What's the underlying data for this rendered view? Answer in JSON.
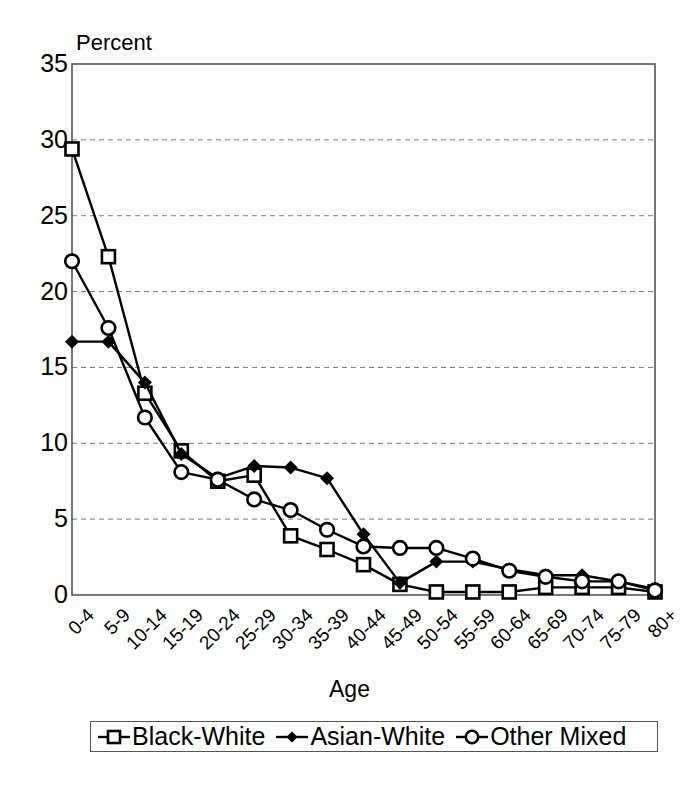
{
  "chart_data": {
    "type": "line",
    "title": "",
    "xlabel": "Age",
    "ylabel": "Percent",
    "ylim": [
      0,
      35
    ],
    "yticks": [
      0,
      5,
      10,
      15,
      20,
      25,
      30,
      35
    ],
    "grid": true,
    "grid_style": "dashed-horizontal",
    "legend_position": "bottom",
    "categories": [
      "0-4",
      "5-9",
      "10-14",
      "15-19",
      "20-24",
      "25-29",
      "30-34",
      "35-39",
      "40-44",
      "45-49",
      "50-54",
      "55-59",
      "60-64",
      "65-69",
      "70-74",
      "75-79",
      "80+"
    ],
    "series": [
      {
        "name": "Black-White",
        "marker": "open-square",
        "values": [
          29.4,
          22.3,
          13.3,
          9.5,
          7.5,
          7.9,
          3.9,
          3.0,
          2.0,
          0.7,
          0.2,
          0.2,
          0.2,
          0.5,
          0.5,
          0.5,
          0.2
        ]
      },
      {
        "name": "Asian-White",
        "marker": "filled-diamond",
        "values": [
          16.7,
          16.7,
          14.0,
          9.3,
          7.7,
          8.5,
          8.4,
          7.7,
          4.0,
          0.8,
          2.2,
          2.2,
          1.7,
          1.3,
          1.3,
          0.9,
          0.4
        ]
      },
      {
        "name": "Other Mixed",
        "marker": "open-circle",
        "values": [
          22.0,
          17.6,
          11.7,
          8.1,
          7.6,
          6.3,
          5.6,
          4.3,
          3.2,
          3.1,
          3.1,
          2.4,
          1.6,
          1.2,
          0.9,
          0.9,
          0.3
        ]
      }
    ]
  },
  "axis": {
    "y_title": "Percent",
    "x_title": "Age"
  },
  "legend": {
    "entries": [
      {
        "label": "Black-White",
        "marker": "open-square"
      },
      {
        "label": "Asian-White",
        "marker": "filled-diamond"
      },
      {
        "label": "Other Mixed",
        "marker": "open-circle"
      }
    ]
  },
  "colors": {
    "line": "#000000",
    "grid": "#7a7a7a",
    "axis": "#555555",
    "background": "#ffffff"
  }
}
